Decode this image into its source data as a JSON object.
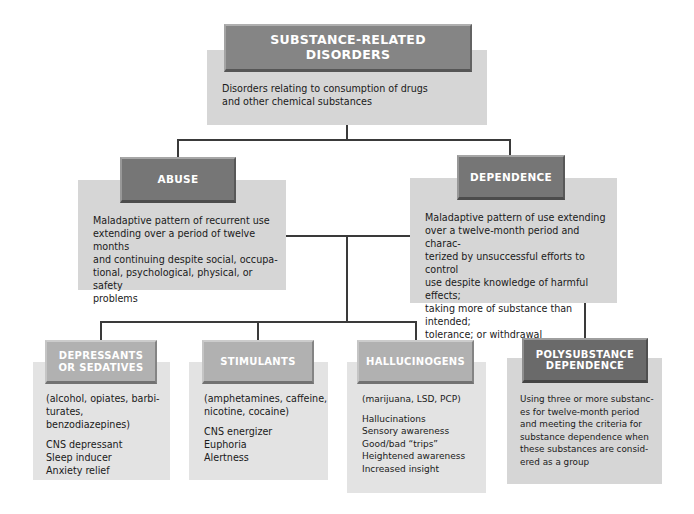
{
  "root": {
    "title": "SUBSTANCE-RELATED DISORDERS",
    "description": "Disorders relating to consumption of drugs and other chemical substances"
  },
  "abuse": {
    "title": "ABUSE",
    "lines": [
      "Maladaptive pattern of recurrent use",
      "extending over a period of twelve months",
      "and continuing despite social, occupa-",
      "tional, psychological, physical, or safety",
      "problems"
    ]
  },
  "dependence": {
    "title": "DEPENDENCE",
    "lines": [
      "Maladaptive pattern of use extending",
      "over a twelve-month period and charac-",
      "terized by unsuccessful efforts to control",
      "use despite knowledge of harmful effects;",
      "taking more of substance than intended;",
      "tolerance; or withdrawal"
    ]
  },
  "depressants": {
    "title_line1": "DEPRESSANTS",
    "title_line2": "OR SEDATIVES",
    "examples": [
      "(alcohol, opiates, barbi-",
      "turates, benzodiazepines)"
    ],
    "effects": [
      "CNS depressant",
      "Sleep inducer",
      "Anxiety relief"
    ]
  },
  "stimulants": {
    "title": "STIMULANTS",
    "examples": [
      "(amphetamines, caffeine,",
      "nicotine, cocaine)"
    ],
    "effects": [
      "CNS energizer",
      "Euphoria",
      "Alertness"
    ]
  },
  "hallucinogens": {
    "title": "HALLUCINOGENS",
    "examples": [
      "(marijuana, LSD, PCP)"
    ],
    "effects": [
      "Hallucinations",
      "Sensory awareness",
      "Good/bad “trips”",
      "Heightened awareness",
      "Increased insight"
    ]
  },
  "polysubstance": {
    "title_line1": "POLYSUBSTANCE",
    "title_line2": "DEPENDENCE",
    "lines": [
      "Using three or more substanc-",
      "es for twelve-month period",
      "and meeting the criteria for",
      "substance dependence when",
      "these substances are consid-",
      "ered as a group"
    ]
  }
}
